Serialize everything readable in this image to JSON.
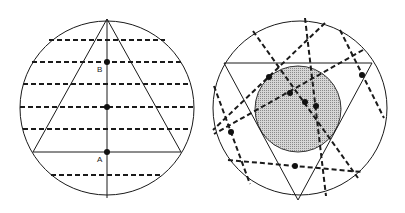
{
  "colors": {
    "stroke": "#1a1a1a",
    "shade": "#bdbdbd",
    "background": "#ffffff"
  },
  "left_figure": {
    "description": "Circle with inscribed upright triangle, vertical median line, and parallel horizontal dashed chords",
    "labels": {
      "point_b": "B",
      "point_a": "A"
    },
    "circle": {
      "cx": 107,
      "cy": 108,
      "r": 88
    },
    "triangle": [
      [
        107,
        20
      ],
      [
        33,
        152
      ],
      [
        181,
        152
      ]
    ],
    "median": [
      [
        107,
        20
      ],
      [
        107,
        197
      ]
    ],
    "dashed_chords_y": [
      40,
      62,
      84,
      107,
      129,
      175
    ],
    "points": [
      {
        "name": "B",
        "x": 107,
        "y": 62
      },
      {
        "name": "mid",
        "x": 107,
        "y": 107
      },
      {
        "name": "A",
        "x": 107,
        "y": 152
      }
    ]
  },
  "right_figure": {
    "description": "Circle with inscribed inverted triangle, shaded inscribed circle, and randomly oriented dashed chords with midpoints",
    "circle": {
      "cx": 300,
      "cy": 108,
      "r": 88
    },
    "triangle": [
      [
        224,
        63
      ],
      [
        372,
        63
      ],
      [
        298,
        200
      ]
    ],
    "shaded_circle": {
      "cx": 298,
      "cy": 109,
      "r": 43
    },
    "points": [
      {
        "x": 269,
        "y": 77
      },
      {
        "x": 290,
        "y": 93
      },
      {
        "x": 305,
        "y": 102
      },
      {
        "x": 316,
        "y": 106
      },
      {
        "x": 362,
        "y": 75
      },
      {
        "x": 231,
        "y": 132
      },
      {
        "x": 295,
        "y": 166
      }
    ]
  }
}
